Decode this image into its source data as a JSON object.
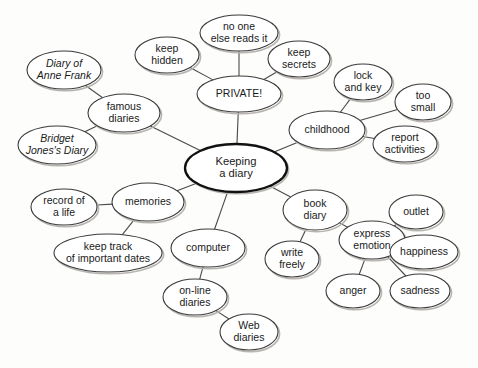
{
  "diagram": {
    "background_color": "#fdfdfc",
    "node_fill": "#ffffff",
    "node_stroke": "#3b3b3b",
    "center_stroke": "#111111",
    "edge_color": "#4a4a4a",
    "shadow_color": "#b8b4b0"
  },
  "nodes": [
    {
      "id": "center",
      "label": "Keeping\na diary",
      "lines": [
        "Keeping",
        "a diary"
      ],
      "cx": 236,
      "cy": 168,
      "rx": 51,
      "ry": 24,
      "style": "center",
      "italic": false
    },
    {
      "id": "private",
      "label": "PRIVATE!",
      "lines": [
        "PRIVATE!"
      ],
      "cx": 239,
      "cy": 94,
      "rx": 42,
      "ry": 18,
      "style": "normal",
      "italic": false
    },
    {
      "id": "noone",
      "label": "no one else reads it",
      "lines": [
        "no one",
        "else reads it"
      ],
      "cx": 239,
      "cy": 33,
      "rx": 39,
      "ry": 18,
      "style": "normal",
      "italic": false
    },
    {
      "id": "keephidden",
      "label": "keep hidden",
      "lines": [
        "keep",
        "hidden"
      ],
      "cx": 167,
      "cy": 55,
      "rx": 32,
      "ry": 18,
      "style": "normal",
      "italic": false
    },
    {
      "id": "keepsecrets",
      "label": "keep secrets",
      "lines": [
        "keep",
        "secrets"
      ],
      "cx": 299,
      "cy": 59,
      "rx": 31,
      "ry": 18,
      "style": "normal",
      "italic": false
    },
    {
      "id": "famous",
      "label": "famous diaries",
      "lines": [
        "famous",
        "diaries"
      ],
      "cx": 124,
      "cy": 113,
      "rx": 36,
      "ry": 19,
      "style": "normal",
      "italic": false
    },
    {
      "id": "annefrank",
      "label": "Diary of Anne Frank",
      "lines": [
        "Diary of",
        "Anne Frank"
      ],
      "cx": 64,
      "cy": 70,
      "rx": 37,
      "ry": 19,
      "style": "normal",
      "italic": true
    },
    {
      "id": "bridget",
      "label": "Bridget Jones's Diary",
      "lines": [
        "Bridget",
        "Jones's Diary"
      ],
      "cx": 57,
      "cy": 145,
      "rx": 39,
      "ry": 19,
      "style": "normal",
      "italic": true
    },
    {
      "id": "childhood",
      "label": "childhood",
      "lines": [
        "childhood"
      ],
      "cx": 327,
      "cy": 130,
      "rx": 38,
      "ry": 19,
      "style": "normal",
      "italic": false
    },
    {
      "id": "lockkey",
      "label": "lock and key",
      "lines": [
        "lock",
        "and key"
      ],
      "cx": 363,
      "cy": 82,
      "rx": 29,
      "ry": 18,
      "style": "normal",
      "italic": false
    },
    {
      "id": "toosmall",
      "label": "too small",
      "lines": [
        "too",
        "small"
      ],
      "cx": 423,
      "cy": 102,
      "rx": 28,
      "ry": 18,
      "style": "normal",
      "italic": false
    },
    {
      "id": "reportact",
      "label": "report activities",
      "lines": [
        "report",
        "activities"
      ],
      "cx": 405,
      "cy": 144,
      "rx": 32,
      "ry": 18,
      "style": "normal",
      "italic": false
    },
    {
      "id": "memories",
      "label": "memories",
      "lines": [
        "memories"
      ],
      "cx": 148,
      "cy": 202,
      "rx": 36,
      "ry": 19,
      "style": "normal",
      "italic": false
    },
    {
      "id": "recordlife",
      "label": "record of a life",
      "lines": [
        "record of",
        "a life"
      ],
      "cx": 64,
      "cy": 207,
      "rx": 33,
      "ry": 18,
      "style": "normal",
      "italic": false
    },
    {
      "id": "keeptrack",
      "label": "keep track of important dates",
      "lines": [
        "keep track",
        "of important dates"
      ],
      "cx": 108,
      "cy": 253,
      "rx": 54,
      "ry": 19,
      "style": "normal",
      "italic": false
    },
    {
      "id": "computer",
      "label": "computer",
      "lines": [
        "computer"
      ],
      "cx": 208,
      "cy": 248,
      "rx": 37,
      "ry": 19,
      "style": "normal",
      "italic": false
    },
    {
      "id": "online",
      "label": "on-line diaries",
      "lines": [
        "on-line",
        "diaries"
      ],
      "cx": 195,
      "cy": 297,
      "rx": 32,
      "ry": 18,
      "style": "normal",
      "italic": false
    },
    {
      "id": "webdiaries",
      "label": "Web diaries",
      "lines": [
        "Web",
        "diaries"
      ],
      "cx": 249,
      "cy": 332,
      "rx": 29,
      "ry": 18,
      "style": "normal",
      "italic": false
    },
    {
      "id": "bookdiary",
      "label": "book diary",
      "lines": [
        "book",
        "diary"
      ],
      "cx": 315,
      "cy": 210,
      "rx": 32,
      "ry": 20,
      "style": "normal",
      "italic": false
    },
    {
      "id": "writefreely",
      "label": "write freely",
      "lines": [
        "write",
        "freely"
      ],
      "cx": 292,
      "cy": 259,
      "rx": 27,
      "ry": 18,
      "style": "normal",
      "italic": false
    },
    {
      "id": "expressemo",
      "label": "express emotion",
      "lines": [
        "express",
        "emotion"
      ],
      "cx": 372,
      "cy": 240,
      "rx": 33,
      "ry": 19,
      "style": "normal",
      "italic": false
    },
    {
      "id": "outlet",
      "label": "outlet",
      "lines": [
        "outlet"
      ],
      "cx": 416,
      "cy": 212,
      "rx": 27,
      "ry": 17,
      "style": "normal",
      "italic": false
    },
    {
      "id": "happiness",
      "label": "happiness",
      "lines": [
        "happiness"
      ],
      "cx": 424,
      "cy": 252,
      "rx": 34,
      "ry": 17,
      "style": "normal",
      "italic": false
    },
    {
      "id": "anger",
      "label": "anger",
      "lines": [
        "anger"
      ],
      "cx": 353,
      "cy": 291,
      "rx": 27,
      "ry": 17,
      "style": "normal",
      "italic": false
    },
    {
      "id": "sadness",
      "label": "sadness",
      "lines": [
        "sadness"
      ],
      "cx": 420,
      "cy": 291,
      "rx": 30,
      "ry": 17,
      "style": "normal",
      "italic": false
    }
  ],
  "edges": [
    {
      "from": "center",
      "to": "private"
    },
    {
      "from": "center",
      "to": "famous"
    },
    {
      "from": "center",
      "to": "childhood"
    },
    {
      "from": "center",
      "to": "memories"
    },
    {
      "from": "center",
      "to": "computer"
    },
    {
      "from": "center",
      "to": "bookdiary"
    },
    {
      "from": "private",
      "to": "noone"
    },
    {
      "from": "private",
      "to": "keephidden"
    },
    {
      "from": "private",
      "to": "keepsecrets"
    },
    {
      "from": "famous",
      "to": "annefrank"
    },
    {
      "from": "famous",
      "to": "bridget"
    },
    {
      "from": "childhood",
      "to": "lockkey"
    },
    {
      "from": "childhood",
      "to": "toosmall"
    },
    {
      "from": "childhood",
      "to": "reportact"
    },
    {
      "from": "memories",
      "to": "recordlife"
    },
    {
      "from": "memories",
      "to": "keeptrack"
    },
    {
      "from": "computer",
      "to": "online"
    },
    {
      "from": "online",
      "to": "webdiaries"
    },
    {
      "from": "bookdiary",
      "to": "writefreely"
    },
    {
      "from": "bookdiary",
      "to": "expressemo"
    },
    {
      "from": "expressemo",
      "to": "outlet"
    },
    {
      "from": "expressemo",
      "to": "happiness"
    },
    {
      "from": "expressemo",
      "to": "anger"
    },
    {
      "from": "expressemo",
      "to": "sadness"
    }
  ]
}
